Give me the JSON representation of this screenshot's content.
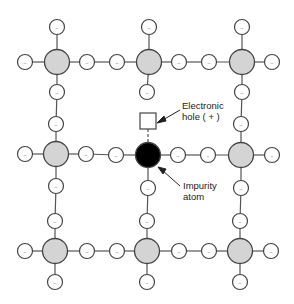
{
  "diagram": {
    "title": "",
    "colors": {
      "atom_fill": "#d4d4d4",
      "impurity_fill": "#000000",
      "electron_fill": "#ffffff",
      "stroke": "#555555"
    },
    "atoms": [
      {
        "x": 57,
        "y": 62,
        "type": "host"
      },
      {
        "x": 149,
        "y": 62,
        "type": "host"
      },
      {
        "x": 242,
        "y": 62,
        "type": "host"
      },
      {
        "x": 56,
        "y": 154,
        "type": "host"
      },
      {
        "x": 148,
        "y": 155,
        "type": "impurity"
      },
      {
        "x": 241,
        "y": 155,
        "type": "host"
      },
      {
        "x": 55,
        "y": 251,
        "type": "host"
      },
      {
        "x": 147,
        "y": 251,
        "type": "host"
      },
      {
        "x": 240,
        "y": 251,
        "type": "host"
      }
    ],
    "electron_symbol": "−",
    "electrons": [
      {
        "x": 57,
        "y": 27
      },
      {
        "x": 149,
        "y": 27
      },
      {
        "x": 242,
        "y": 27
      },
      {
        "x": 25,
        "y": 62
      },
      {
        "x": 87,
        "y": 62
      },
      {
        "x": 117,
        "y": 62
      },
      {
        "x": 179,
        "y": 62
      },
      {
        "x": 209,
        "y": 62
      },
      {
        "x": 272,
        "y": 62
      },
      {
        "x": 57,
        "y": 92
      },
      {
        "x": 147,
        "y": 92
      },
      {
        "x": 242,
        "y": 92
      },
      {
        "x": 56,
        "y": 124
      },
      {
        "x": 241,
        "y": 124
      },
      {
        "x": 25,
        "y": 154
      },
      {
        "x": 86,
        "y": 154
      },
      {
        "x": 116,
        "y": 155
      },
      {
        "x": 178,
        "y": 155
      },
      {
        "x": 208,
        "y": 155
      },
      {
        "x": 272,
        "y": 155
      },
      {
        "x": 56,
        "y": 186
      },
      {
        "x": 148,
        "y": 188
      },
      {
        "x": 241,
        "y": 188
      },
      {
        "x": 55,
        "y": 221
      },
      {
        "x": 147,
        "y": 221
      },
      {
        "x": 240,
        "y": 221
      },
      {
        "x": 25,
        "y": 251
      },
      {
        "x": 87,
        "y": 251
      },
      {
        "x": 117,
        "y": 251
      },
      {
        "x": 179,
        "y": 251
      },
      {
        "x": 209,
        "y": 251
      },
      {
        "x": 271,
        "y": 251
      },
      {
        "x": 55,
        "y": 282
      },
      {
        "x": 147,
        "y": 282
      },
      {
        "x": 240,
        "y": 282
      }
    ],
    "hole": {
      "x": 148,
      "y": 121,
      "size": 16
    },
    "labels": {
      "hole_line1": "Electronic",
      "hole_line2": "hole ( + )",
      "impurity_line1": "Impurity",
      "impurity_line2": "atom"
    }
  }
}
